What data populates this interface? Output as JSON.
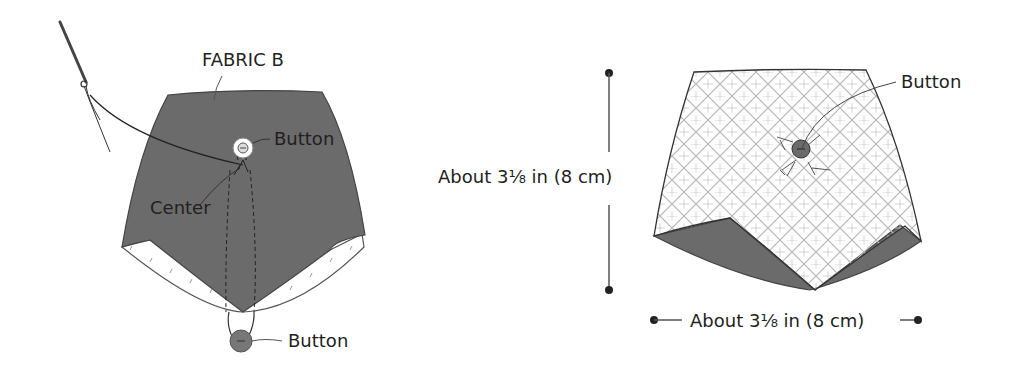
{
  "left_figure": {
    "fabric_label": "FABRIC B",
    "button_top_label": "Button",
    "center_label": "Center",
    "button_bottom_label": "Button"
  },
  "right_figure": {
    "button_label": "Button",
    "height_dimension": "About 3⅛ in (8 cm)",
    "width_dimension": "About 3⅛ in (8 cm)"
  },
  "colors": {
    "fabric_dark": "#6b6b6b",
    "outline": "#3a3a3a",
    "text": "#231f20",
    "pattern": "#b5b5b5"
  }
}
